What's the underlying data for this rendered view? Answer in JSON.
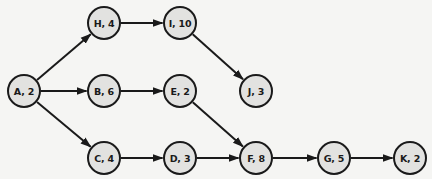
{
  "diagram": {
    "type": "activity-network",
    "colors": {
      "node_fill": "#e2e2e0",
      "node_stroke": "#1a1a1a",
      "edge": "#1a1a1a",
      "background": "#f5f5f3"
    },
    "nodes": [
      {
        "id": "A",
        "label": "A, 2",
        "duration": 2,
        "x": 24,
        "y": 91
      },
      {
        "id": "H",
        "label": "H, 4",
        "duration": 4,
        "x": 104,
        "y": 23
      },
      {
        "id": "I",
        "label": "I, 10",
        "duration": 10,
        "x": 180,
        "y": 23
      },
      {
        "id": "B",
        "label": "B, 6",
        "duration": 6,
        "x": 104,
        "y": 91
      },
      {
        "id": "E",
        "label": "E, 2",
        "duration": 2,
        "x": 180,
        "y": 91
      },
      {
        "id": "J",
        "label": "J, 3",
        "duration": 3,
        "x": 256,
        "y": 91
      },
      {
        "id": "C",
        "label": "C, 4",
        "duration": 4,
        "x": 104,
        "y": 158
      },
      {
        "id": "D",
        "label": "D, 3",
        "duration": 3,
        "x": 180,
        "y": 158
      },
      {
        "id": "F",
        "label": "F, 8",
        "duration": 8,
        "x": 256,
        "y": 158
      },
      {
        "id": "G",
        "label": "G, 5",
        "duration": 5,
        "x": 334,
        "y": 158
      },
      {
        "id": "K",
        "label": "K, 2",
        "duration": 2,
        "x": 410,
        "y": 158
      }
    ],
    "edges": [
      {
        "from": "A",
        "to": "H"
      },
      {
        "from": "A",
        "to": "B"
      },
      {
        "from": "A",
        "to": "C"
      },
      {
        "from": "H",
        "to": "I"
      },
      {
        "from": "I",
        "to": "J"
      },
      {
        "from": "B",
        "to": "E"
      },
      {
        "from": "E",
        "to": "F"
      },
      {
        "from": "C",
        "to": "D"
      },
      {
        "from": "D",
        "to": "F"
      },
      {
        "from": "F",
        "to": "G"
      },
      {
        "from": "G",
        "to": "K"
      }
    ]
  }
}
